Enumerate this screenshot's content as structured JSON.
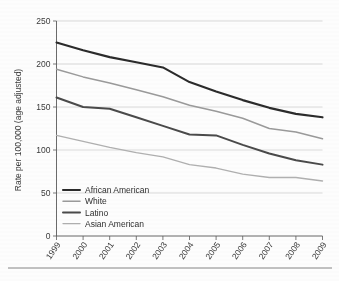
{
  "chart_data": {
    "type": "line",
    "title": "",
    "xlabel": "",
    "ylabel": "Rate per 100,000 (age adjusted)",
    "x": [
      "1999",
      "2000",
      "2001",
      "2002",
      "2003",
      "2004",
      "2005",
      "2006",
      "2007",
      "2008",
      "2009"
    ],
    "categories": [
      "1999",
      "2000",
      "2001",
      "2002",
      "2003",
      "2004",
      "2005",
      "2006",
      "2007",
      "2008",
      "2009"
    ],
    "ylim": [
      0,
      250
    ],
    "yticks": [
      0,
      50,
      100,
      150,
      200,
      250
    ],
    "ytick_labels": [
      "0",
      "50",
      "100",
      "150",
      "200",
      "250"
    ],
    "grid": "horizontal",
    "legend_position": "lower-left-inside",
    "series": [
      {
        "name": "African American",
        "color": "#2b2b2b",
        "width": 2.1,
        "values": [
          225,
          216,
          208,
          202,
          196,
          179,
          168,
          158,
          149,
          142,
          138
        ]
      },
      {
        "name": "White",
        "color": "#9a9a9a",
        "width": 1.5,
        "values": [
          194,
          185,
          178,
          170,
          162,
          152,
          145,
          137,
          125,
          121,
          113
        ]
      },
      {
        "name": "Latino",
        "color": "#4a4a4a",
        "width": 2.0,
        "values": [
          161,
          150,
          148,
          138,
          128,
          118,
          117,
          106,
          96,
          88,
          83
        ]
      },
      {
        "name": "Asian American",
        "color": "#b0b0b0",
        "width": 1.4,
        "values": [
          117,
          110,
          103,
          97,
          92,
          83,
          79,
          72,
          68,
          68,
          64
        ]
      }
    ]
  },
  "legend": {
    "items": [
      {
        "label": "African American"
      },
      {
        "label": "White"
      },
      {
        "label": "Latino"
      },
      {
        "label": "Asian American"
      }
    ]
  },
  "colors": {
    "african_american": "#2b2b2b",
    "white": "#9a9a9a",
    "latino": "#4a4a4a",
    "asian_american": "#b0b0b0",
    "grid": "#c9c9c9",
    "axis": "#5a5a5a",
    "background": "#fdfdfd"
  }
}
